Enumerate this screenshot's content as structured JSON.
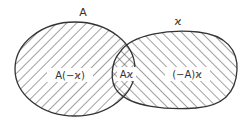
{
  "diagram": {
    "type": "venn",
    "sets": [
      {
        "id": "A",
        "label": "A"
      },
      {
        "id": "x",
        "label": "ϰ"
      }
    ],
    "regions": [
      {
        "id": "a-only",
        "label": "A(−ϰ)"
      },
      {
        "id": "intersection",
        "label": "Aϰ"
      },
      {
        "id": "x-only",
        "label": "(−A)ϰ"
      }
    ],
    "colors": {
      "stroke": "#333333",
      "hatch": "#444444",
      "background": "#ffffff"
    }
  }
}
